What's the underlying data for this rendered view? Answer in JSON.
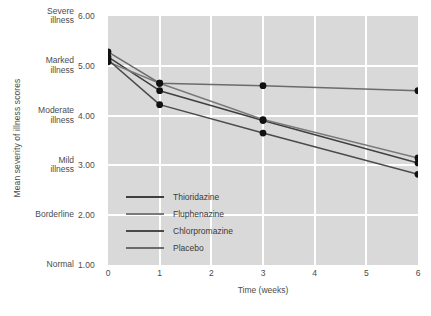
{
  "chart_data": {
    "type": "line",
    "title": "",
    "xlabel": "Time (weeks)",
    "ylabel": "Mean severity of illness scores",
    "xlim": [
      0,
      6
    ],
    "ylim": [
      1.0,
      6.0
    ],
    "grid": true,
    "legend_position": "inside-lower-left",
    "x": [
      0,
      1,
      3,
      6
    ],
    "xticks": [
      "0",
      "1",
      "2",
      "3",
      "4",
      "5",
      "6"
    ],
    "yticks": [
      {
        "value": "6.00",
        "desc": "Severe\nillness"
      },
      {
        "value": "5.00",
        "desc": "Marked\nillness"
      },
      {
        "value": "4.00",
        "desc": "Moderate\nillness"
      },
      {
        "value": "3.00",
        "desc": "Mild\nillness"
      },
      {
        "value": "2.00",
        "desc": "Borderline"
      },
      {
        "value": "1.00",
        "desc": "Normal"
      }
    ],
    "series": [
      {
        "name": "Thioridazine",
        "color": "#3f3f3f",
        "values": [
          5.18,
          4.5,
          3.9,
          3.05
        ]
      },
      {
        "name": "Fluphenazine",
        "color": "#7a7a7a",
        "values": [
          5.08,
          4.65,
          3.92,
          3.15
        ]
      },
      {
        "name": "Chlorpromazine",
        "color": "#4a4a4a",
        "values": [
          5.12,
          4.22,
          3.65,
          2.82
        ]
      },
      {
        "name": "Placebo",
        "color": "#6b6b6b",
        "values": [
          5.28,
          4.65,
          4.6,
          4.5
        ]
      }
    ]
  },
  "legend": {
    "items": [
      {
        "label": "Thioridazine"
      },
      {
        "label": "Fluphenazine"
      },
      {
        "label": "Chlorpromazine"
      },
      {
        "label": "Placebo"
      }
    ]
  },
  "colors": {
    "plot_background": "#d9d9d9",
    "gridline": "#ffffff",
    "text": "#4c4c4c",
    "marker": "#111111"
  }
}
